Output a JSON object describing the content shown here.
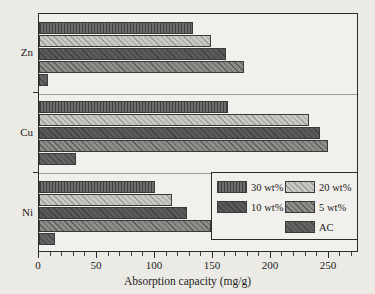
{
  "chart_data": {
    "type": "bar",
    "orientation": "horizontal",
    "title": "",
    "xlabel": "Absorption capacity (mg/g)",
    "ylabel": "",
    "categories": [
      "Zn",
      "Cu",
      "Ni"
    ],
    "xlim": [
      0,
      276
    ],
    "xticks": [
      0,
      50,
      100,
      150,
      200,
      250
    ],
    "xticklabels": [
      "0",
      "50",
      "100",
      "150",
      "200",
      "250"
    ],
    "grid": false,
    "legend_position": "lower right",
    "series": [
      {
        "name": "30 wt%",
        "values": [
          133,
          163,
          100
        ]
      },
      {
        "name": "20 wt%",
        "values": [
          148,
          233,
          115
        ]
      },
      {
        "name": "10 wt%",
        "values": [
          161,
          242,
          128
        ]
      },
      {
        "name": "5 wt%",
        "values": [
          177,
          249,
          148
        ]
      },
      {
        "name": "AC",
        "values": [
          8,
          32,
          14
        ]
      }
    ]
  },
  "axis": {
    "x_title": "Absorption capacity (mg/g)",
    "tick_labels": [
      "0",
      "50",
      "100",
      "150",
      "200",
      "250"
    ],
    "group_labels": [
      "Zn",
      "Cu",
      "Ni"
    ]
  },
  "legend": {
    "entries": [
      {
        "label": "30 wt%",
        "pattern": "vertical-hatch-dark"
      },
      {
        "label": "20 wt%",
        "pattern": "diagonal-hatch-light"
      },
      {
        "label": "10 wt%",
        "pattern": "solid-dark"
      },
      {
        "label": "5 wt%",
        "pattern": "diagonal-hatch-medium"
      },
      {
        "label": "AC",
        "pattern": "solid-gray"
      }
    ]
  },
  "colors": {
    "background": "#eceae5",
    "plot_background": "#f2f0ec",
    "axis": "#2b2b2b",
    "series_30": "#6d6d6d",
    "series_20": "#c9c7c2",
    "series_10": "#5a5a5a",
    "series_5": "#8e8c88",
    "series_ac": "#636363"
  }
}
